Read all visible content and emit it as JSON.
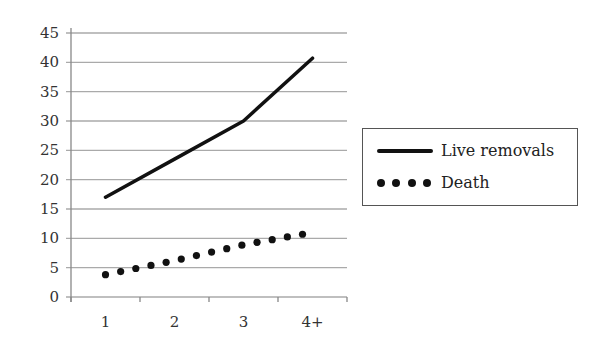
{
  "chart_data": {
    "type": "line",
    "title": "",
    "xlabel": "",
    "ylabel": "",
    "categories": [
      "1",
      "2",
      "3",
      "4+"
    ],
    "ylim": [
      0,
      45
    ],
    "yticks": [
      0,
      5,
      10,
      15,
      20,
      25,
      30,
      35,
      40,
      45
    ],
    "grid": true,
    "legend_position": "right",
    "series": [
      {
        "name": "Live removals",
        "style": "solid",
        "values": [
          17,
          23.5,
          30,
          40.7
        ]
      },
      {
        "name": "Death",
        "style": "dotted",
        "values": [
          3.8,
          6.2,
          8.9,
          11
        ]
      }
    ]
  },
  "legend": {
    "items": [
      {
        "label": "Live removals"
      },
      {
        "label": "Death"
      }
    ]
  },
  "colors": {
    "line": "#111111",
    "grid": "#aaaaaa",
    "axis": "#888888"
  }
}
